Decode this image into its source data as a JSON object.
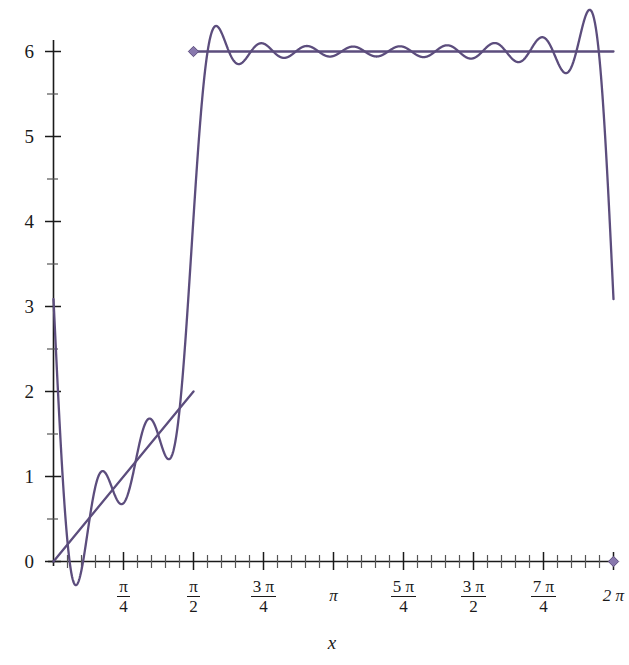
{
  "chart_data": {
    "type": "line",
    "title": "",
    "xlabel": "x",
    "ylabel": "",
    "xlim": [
      -0.08,
      6.45
    ],
    "ylim": [
      -0.35,
      6.62
    ],
    "grid": false,
    "legend": "none",
    "background": "#ffffff",
    "curve_color": "#5c4d7d",
    "axis_color": "#1a1a1a",
    "marker_color": "#8878ad",
    "x_axis": {
      "tick_labels": [
        {
          "value": 0.7853981634,
          "num": "π",
          "den": "4",
          "display": "π/4"
        },
        {
          "value": 1.5707963268,
          "num": "π",
          "den": "2",
          "display": "π/2"
        },
        {
          "value": 2.3561944902,
          "num": "3 π",
          "den": "4",
          "display": "3π/4"
        },
        {
          "value": 3.1415926536,
          "num": "π",
          "den": "",
          "display": "π"
        },
        {
          "value": 3.926990817,
          "num": "5 π",
          "den": "4",
          "display": "5π/4"
        },
        {
          "value": 4.7123889804,
          "num": "3 π",
          "den": "2",
          "display": "3π/2"
        },
        {
          "value": 5.4977871438,
          "num": "7 π",
          "den": "4",
          "display": "7π/4"
        },
        {
          "value": 6.2831853072,
          "num": "2 π",
          "den": "",
          "display": "2π"
        }
      ],
      "minor_ticks_between": 4
    },
    "y_axis": {
      "tick_labels": [
        "0",
        "1",
        "2",
        "3",
        "4",
        "5",
        "6"
      ],
      "tick_values": [
        0,
        1,
        2,
        3,
        4,
        5,
        6
      ],
      "minor_ticks_between": 1
    },
    "series": [
      {
        "name": "target-step-function",
        "description": "Piecewise target: linear ramp 4x/pi on [0, pi/2], constant 6 on (pi/2, 2pi]",
        "style": "solid",
        "color": "#5c4d7d",
        "pieces": [
          {
            "kind": "ramp",
            "x_start": 0.0,
            "x_end": 1.5707963268,
            "y_start": 0.0,
            "y_end": 2.0
          },
          {
            "kind": "constant",
            "x_start": 1.5707963268,
            "x_end": 6.2831853072,
            "y": 6.0
          }
        ]
      },
      {
        "name": "fourier-partial-sum",
        "description": "Fourier partial sum approximation exhibiting Gibbs oscillations about the step",
        "style": "solid",
        "color": "#5c4d7d",
        "harmonics": 11,
        "overshoot_peak": 6.38,
        "undershoot_trough": 5.75
      }
    ],
    "markers": [
      {
        "name": "left-step-endpoint",
        "x": 1.5707963268,
        "y": 6.0,
        "shape": "diamond",
        "color": "#8878ad"
      },
      {
        "name": "right-axis-endpoint",
        "x": 6.2831853072,
        "y": 0.0,
        "shape": "diamond",
        "color": "#8878ad"
      }
    ]
  }
}
